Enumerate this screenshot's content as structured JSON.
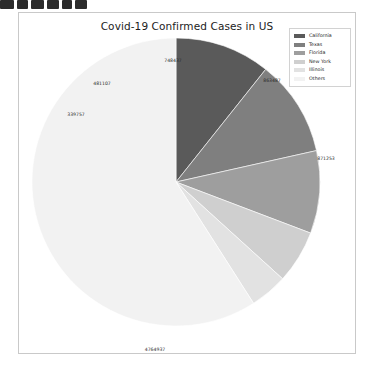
{
  "page": {
    "background_color": "#ffffff",
    "artifact_blocks": [
      {
        "left": 0,
        "width": 14
      },
      {
        "left": 17,
        "width": 11
      },
      {
        "left": 31,
        "width": 13
      },
      {
        "left": 47,
        "width": 12
      },
      {
        "left": 62,
        "width": 10
      },
      {
        "left": 75,
        "width": 12
      }
    ]
  },
  "chart_panel": {
    "border_color": "#c9c9c9",
    "background_color": "#ffffff"
  },
  "chart_data": {
    "type": "pie",
    "title": "Covid-19 Confirmed Cases in US",
    "xlabel": "",
    "ylabel": "",
    "start_angle_deg": 90,
    "direction": "clockwise",
    "legend_position": "upper right",
    "grid": false,
    "categories": [
      "California",
      "Texas",
      "Florida",
      "New York",
      "Illinois",
      "Others"
    ],
    "values": [
      863487,
      871253,
      748437,
      481107,
      339757,
      4764937
    ],
    "labels": [
      "863487",
      "871253",
      "748437",
      "481107",
      "339757",
      "4764937"
    ],
    "colors": [
      "#5a5a5a",
      "#7f7f7f",
      "#9e9e9e",
      "#cfcfcf",
      "#e2e2e2",
      "#f2f2f2"
    ],
    "total": 8068978,
    "slices": [
      {
        "name": "California",
        "value": 863487,
        "label": "863487",
        "color": "#5a5a5a",
        "label_x": 253,
        "label_y": 67
      },
      {
        "name": "Texas",
        "value": 871253,
        "label": "871253",
        "color": "#7f7f7f",
        "label_x": 307,
        "label_y": 145
      },
      {
        "name": "Florida",
        "value": 748437,
        "label": "748437",
        "color": "#9e9e9e",
        "label_x": 154,
        "label_y": 47
      },
      {
        "name": "New York",
        "value": 481107,
        "label": "481107",
        "color": "#cfcfcf",
        "label_x": 83,
        "label_y": 70
      },
      {
        "name": "Illinois",
        "value": 339757,
        "label": "339757",
        "color": "#e2e2e2",
        "label_x": 57,
        "label_y": 101
      },
      {
        "name": "Others",
        "value": 4764937,
        "label": "4764937",
        "color": "#f2f2f2",
        "label_x": 136,
        "label_y": 336
      }
    ]
  },
  "legend": {
    "items": [
      {
        "label": "California",
        "color": "#5a5a5a"
      },
      {
        "label": "Texas",
        "color": "#7f7f7f"
      },
      {
        "label": "Florida",
        "color": "#9e9e9e"
      },
      {
        "label": "New York",
        "color": "#cfcfcf"
      },
      {
        "label": "Illinois",
        "color": "#e2e2e2"
      },
      {
        "label": "Others",
        "color": "#f2f2f2"
      }
    ]
  }
}
